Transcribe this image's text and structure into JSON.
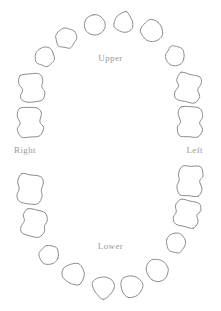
{
  "chart_data": {
    "type": "diagram",
    "subtype": "odontogram",
    "arches": 2,
    "total_teeth": 32,
    "teeth_per_arch": 16,
    "layout": "oval",
    "grid": false,
    "legend": false,
    "orientation_labels": [
      "Upper",
      "Lower",
      "Right",
      "Left"
    ],
    "tooth_shape_classes": [
      "incisor",
      "canine",
      "premolar",
      "molar"
    ],
    "teeth": [
      {
        "arch": "upper",
        "side": "right",
        "index": 1,
        "class": "molar",
        "cx": 30,
        "cy": 122,
        "w": 26,
        "h": 30,
        "rot": -4
      },
      {
        "arch": "upper",
        "side": "right",
        "index": 2,
        "class": "molar",
        "cx": 32,
        "cy": 88,
        "w": 26,
        "h": 28,
        "rot": -10
      },
      {
        "arch": "upper",
        "side": "right",
        "index": 3,
        "class": "premolar",
        "cx": 45,
        "cy": 57,
        "w": 21,
        "h": 21,
        "rot": -22
      },
      {
        "arch": "upper",
        "side": "right",
        "index": 4,
        "class": "premolar",
        "cx": 66,
        "cy": 38,
        "w": 23,
        "h": 22,
        "rot": -34
      },
      {
        "arch": "upper",
        "side": "right",
        "index": 5,
        "class": "canine",
        "cx": 95,
        "cy": 25,
        "w": 22,
        "h": 21,
        "rot": -16
      },
      {
        "arch": "upper",
        "side": "right",
        "index": 6,
        "class": "incisor",
        "cx": 124,
        "cy": 22,
        "w": 21,
        "h": 21,
        "rot": 10
      },
      {
        "arch": "upper",
        "side": "left",
        "index": 7,
        "class": "canine",
        "cx": 152,
        "cy": 31,
        "w": 22,
        "h": 22,
        "rot": 30
      },
      {
        "arch": "upper",
        "side": "left",
        "index": 8,
        "class": "premolar",
        "cx": 175,
        "cy": 56,
        "w": 21,
        "h": 21,
        "rot": 20
      },
      {
        "arch": "upper",
        "side": "left",
        "index": 9,
        "class": "molar",
        "cx": 188,
        "cy": 88,
        "w": 26,
        "h": 28,
        "rot": 10
      },
      {
        "arch": "upper",
        "side": "left",
        "index": 10,
        "class": "molar",
        "cx": 190,
        "cy": 122,
        "w": 26,
        "h": 30,
        "rot": 4
      },
      {
        "arch": "lower",
        "side": "right",
        "index": 11,
        "class": "molar",
        "cx": 30,
        "cy": 189,
        "w": 27,
        "h": 30,
        "rot": 3
      },
      {
        "arch": "lower",
        "side": "right",
        "index": 12,
        "class": "molar",
        "cx": 34,
        "cy": 223,
        "w": 26,
        "h": 27,
        "rot": 12
      },
      {
        "arch": "lower",
        "side": "right",
        "index": 13,
        "class": "premolar",
        "cx": 49,
        "cy": 255,
        "w": 21,
        "h": 21,
        "rot": 22
      },
      {
        "arch": "lower",
        "side": "right",
        "index": 14,
        "class": "incisor",
        "cx": 74,
        "cy": 275,
        "w": 24,
        "h": 23,
        "rot": 150
      },
      {
        "arch": "lower",
        "side": "right",
        "index": 15,
        "class": "incisor",
        "cx": 103,
        "cy": 288,
        "w": 23,
        "h": 23,
        "rot": 178
      },
      {
        "arch": "lower",
        "side": "left",
        "index": 16,
        "class": "incisor",
        "cx": 131,
        "cy": 287,
        "w": 23,
        "h": 23,
        "rot": 196
      },
      {
        "arch": "lower",
        "side": "left",
        "index": 17,
        "class": "canine",
        "cx": 157,
        "cy": 270,
        "w": 23,
        "h": 22,
        "rot": 205
      },
      {
        "arch": "lower",
        "side": "left",
        "index": 18,
        "class": "premolar",
        "cx": 176,
        "cy": 243,
        "w": 21,
        "h": 21,
        "rot": 200
      },
      {
        "arch": "lower",
        "side": "left",
        "index": 19,
        "class": "molar",
        "cx": 187,
        "cy": 214,
        "w": 26,
        "h": 27,
        "rot": 192
      },
      {
        "arch": "lower",
        "side": "left",
        "index": 20,
        "class": "molar",
        "cx": 190,
        "cy": 181,
        "w": 26,
        "h": 30,
        "rot": 183
      }
    ]
  },
  "labels": {
    "upper": "Upper",
    "lower": "Lower",
    "right": "Right",
    "left": "Left"
  },
  "colors": {
    "outline": "#8a8a8a",
    "label": "#9a9a9a",
    "background": "#ffffff"
  }
}
